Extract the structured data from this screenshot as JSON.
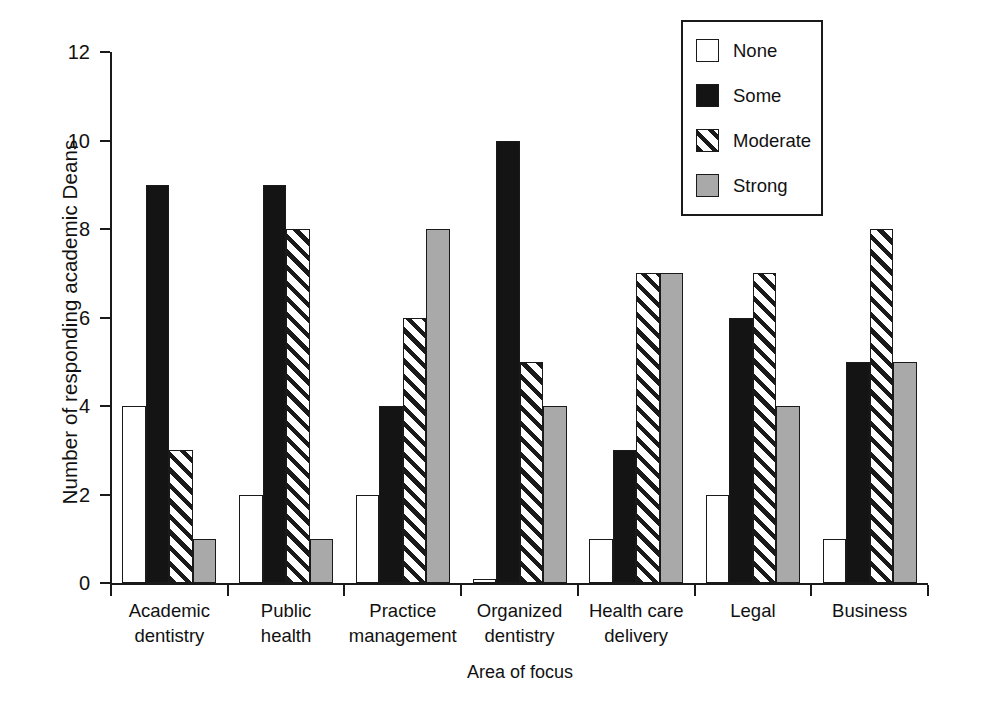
{
  "chart_data": {
    "type": "bar",
    "title": "",
    "xlabel": "Area of focus",
    "ylabel": "Number of responding academic Deans",
    "ylim": [
      0,
      12
    ],
    "ytick_labels": [
      "0",
      "2",
      "4",
      "6",
      "8",
      "10",
      "12"
    ],
    "yticks": [
      0,
      2,
      4,
      6,
      8,
      10,
      12
    ],
    "grid": false,
    "legend_position": "top-right",
    "categories": [
      "Academic dentistry",
      "Public health",
      "Practice management",
      "Organized dentistry",
      "Health care delivery",
      "Legal",
      "Business"
    ],
    "category_lines": [
      [
        "Academic",
        "dentistry"
      ],
      [
        "Public",
        "health"
      ],
      [
        "Practice",
        "management"
      ],
      [
        "Organized",
        "dentistry"
      ],
      [
        "Health care",
        "delivery"
      ],
      [
        "Legal"
      ],
      [
        "Business"
      ]
    ],
    "series": [
      {
        "name": "None",
        "fill": "white",
        "values": [
          4,
          2,
          2,
          0.1,
          1,
          2,
          1
        ]
      },
      {
        "name": "Some",
        "fill": "black",
        "values": [
          9,
          9,
          4,
          10,
          3,
          6,
          5
        ]
      },
      {
        "name": "Moderate",
        "fill": "hatch",
        "values": [
          3,
          8,
          6,
          5,
          7,
          7,
          8
        ]
      },
      {
        "name": "Strong",
        "fill": "gray",
        "values": [
          1,
          1,
          8,
          4,
          7,
          4,
          5
        ]
      }
    ]
  },
  "legend": {
    "items": [
      {
        "label": "None",
        "swatch": "swatch-none-icon"
      },
      {
        "label": "Some",
        "swatch": "swatch-some-icon"
      },
      {
        "label": "Moderate",
        "swatch": "swatch-moderate-icon"
      },
      {
        "label": "Strong",
        "swatch": "swatch-strong-icon"
      }
    ]
  },
  "colors": {
    "none": "#ffffff",
    "some": "#141414",
    "moderate": "#ffffff",
    "strong": "#a9a9a9",
    "outline": "#1a1a1a",
    "background": "#ffffff"
  }
}
